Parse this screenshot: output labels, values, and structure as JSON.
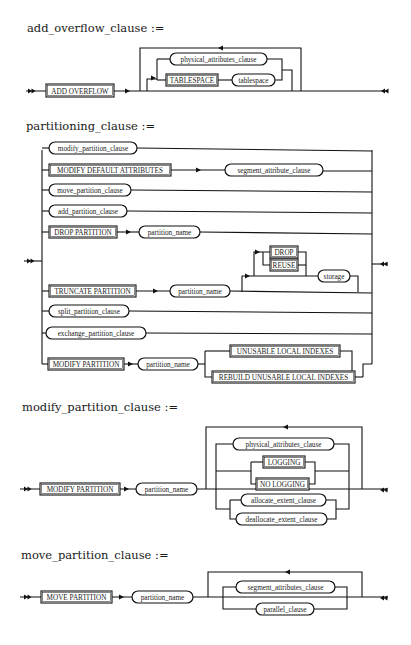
{
  "diagrams": {
    "add_overflow": {
      "title": "add_overflow_clause :=",
      "keywords": {
        "add_overflow": "ADD OVERFLOW",
        "tablespace_kw": "TABLESPACE"
      },
      "nonterminals": {
        "physical_attributes": "physical_attributes_clause",
        "tablespace": "tablespace"
      }
    },
    "partitioning": {
      "title": "partitioning_clause :=",
      "rows": {
        "modify_partition_clause": "modify_partition_clause",
        "modify_default_attributes": "MODIFY DEFAULT ATTRIBUTES",
        "segment_attribute_clause": "segment_attribute_clause",
        "move_partition_clause": "move_partition_clause",
        "add_partition_clause": "add_partition_clause",
        "drop_partition": "DROP PARTITION",
        "drop_partition_name": "partition_name",
        "truncate_partition": "TRUNCATE PARTITION",
        "truncate_partition_name": "partition_name",
        "drop": "DROP",
        "reuse": "REUSE",
        "storage": "storage",
        "split_partition_clause": "split_partition_clause",
        "exchange_partition_clause": "exchange_partition_clause",
        "modify_partition": "MODIFY PARTITION",
        "modify_partition_name": "partition_name",
        "unusable_local_indexes": "UNUSABLE LOCAL INDEXES",
        "rebuild_unusable_local_indexes": "REBUILD UNUSABLE LOCAL INDEXES"
      }
    },
    "modify_partition": {
      "title": "modify_partition_clause :=",
      "keywords": {
        "modify_partition": "MODIFY PARTITION",
        "logging": "LOGGING",
        "no_logging": "NO LOGGING"
      },
      "nonterminals": {
        "partition_name": "partition_name",
        "physical_attributes": "physical_attributes_clause",
        "allocate_extent": "allocate_extent_clause",
        "deallocate_extent": "deallocate_extent_clause"
      }
    },
    "move_partition": {
      "title": "move_partition_clause :=",
      "keywords": {
        "move_partition": "MOVE PARTITION"
      },
      "nonterminals": {
        "partition_name": "partition_name",
        "segment_attributes": "segment_attributes_clause",
        "parallel": "parallel_clause"
      }
    }
  }
}
